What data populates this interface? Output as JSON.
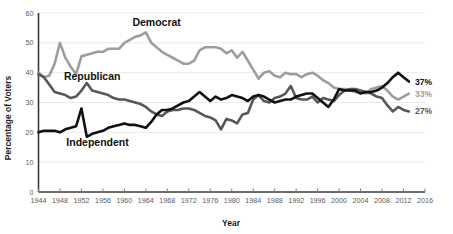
{
  "chart_data": {
    "type": "line",
    "title": "",
    "xlabel": "Year",
    "ylabel": "Percentage of Voters",
    "xlim": [
      1944,
      2016
    ],
    "ylim": [
      0,
      60
    ],
    "grid": true,
    "legend": "inline-labels",
    "xticks": [
      1944,
      1948,
      1952,
      1956,
      1960,
      1964,
      1968,
      1972,
      1976,
      1980,
      1984,
      1988,
      1992,
      1996,
      2000,
      2004,
      2008,
      2012,
      2016
    ],
    "yticks": [
      0,
      10,
      20,
      30,
      40,
      50,
      60
    ],
    "x": [
      1944,
      1945,
      1946,
      1947,
      1948,
      1949,
      1950,
      1951,
      1952,
      1953,
      1954,
      1955,
      1956,
      1957,
      1958,
      1959,
      1960,
      1961,
      1962,
      1963,
      1964,
      1965,
      1966,
      1967,
      1968,
      1969,
      1970,
      1971,
      1972,
      1973,
      1974,
      1975,
      1976,
      1977,
      1978,
      1979,
      1980,
      1981,
      1982,
      1983,
      1984,
      1985,
      1986,
      1987,
      1988,
      1989,
      1990,
      1991,
      1992,
      1993,
      1994,
      1995,
      1996,
      1997,
      1998,
      1999,
      2000,
      2001,
      2002,
      2003,
      2004,
      2005,
      2006,
      2007,
      2008,
      2009,
      2010,
      2011,
      2012,
      2013
    ],
    "series": [
      {
        "name": "Democrat",
        "color": "#9d9d9d",
        "end_label": "33%",
        "values": [
          40.0,
          38.5,
          39.0,
          43.0,
          50.0,
          45.0,
          42.0,
          39.5,
          45.5,
          46.0,
          46.5,
          47.0,
          47.0,
          48.0,
          48.0,
          48.0,
          50.0,
          51.0,
          52.0,
          52.5,
          53.5,
          50.0,
          48.5,
          47.0,
          46.0,
          45.0,
          44.0,
          43.0,
          43.0,
          44.0,
          47.5,
          48.5,
          48.5,
          48.5,
          48.0,
          46.5,
          47.5,
          45.0,
          47.0,
          44.0,
          41.0,
          38.0,
          40.0,
          40.5,
          39.0,
          38.5,
          40.0,
          39.5,
          39.5,
          38.5,
          39.5,
          40.0,
          39.0,
          37.5,
          36.5,
          35.0,
          34.5,
          34.5,
          34.0,
          33.5,
          33.5,
          33.0,
          34.5,
          35.0,
          35.5,
          34.0,
          32.0,
          31.0,
          32.0,
          33.0
        ]
      },
      {
        "name": "Republican",
        "color": "#575757",
        "end_label": "27%",
        "values": [
          39.5,
          38.5,
          36.0,
          33.5,
          33.0,
          32.5,
          31.5,
          32.0,
          34.0,
          36.5,
          34.0,
          33.5,
          33.0,
          32.5,
          31.5,
          31.0,
          31.0,
          30.5,
          30.0,
          29.5,
          28.5,
          27.0,
          26.0,
          25.5,
          27.0,
          27.5,
          27.5,
          28.0,
          28.0,
          27.5,
          26.5,
          25.5,
          25.0,
          24.0,
          21.0,
          24.5,
          24.0,
          23.0,
          26.0,
          26.5,
          31.0,
          32.5,
          30.5,
          30.0,
          31.5,
          32.0,
          33.0,
          35.5,
          31.5,
          31.0,
          31.0,
          32.0,
          30.0,
          31.5,
          31.0,
          30.5,
          32.5,
          34.0,
          34.5,
          34.5,
          34.0,
          33.5,
          33.0,
          32.0,
          31.5,
          29.0,
          27.0,
          28.5,
          27.5,
          27.0
        ]
      },
      {
        "name": "Independent",
        "color": "#111111",
        "end_label": "37%",
        "values": [
          20.0,
          20.5,
          20.5,
          20.5,
          20.0,
          21.0,
          21.5,
          22.0,
          28.0,
          18.5,
          19.5,
          20.0,
          20.5,
          21.5,
          22.0,
          22.5,
          23.0,
          22.5,
          22.5,
          22.0,
          21.5,
          23.5,
          26.0,
          27.5,
          27.5,
          28.0,
          29.0,
          30.0,
          30.5,
          32.0,
          33.5,
          32.0,
          30.5,
          32.0,
          31.0,
          31.5,
          32.5,
          32.0,
          31.5,
          30.5,
          32.0,
          32.5,
          32.0,
          31.0,
          30.0,
          30.5,
          31.0,
          31.0,
          32.0,
          32.5,
          33.0,
          33.0,
          31.5,
          30.0,
          28.5,
          31.0,
          34.5,
          34.0,
          34.0,
          34.0,
          33.0,
          33.5,
          33.5,
          34.0,
          35.0,
          36.5,
          38.5,
          40.0,
          38.5,
          37.0
        ]
      }
    ],
    "annotations": [
      {
        "name": "Democrat",
        "text": "Democrat",
        "x": 1966,
        "y": 55.5
      },
      {
        "name": "Republican",
        "text": "Republican",
        "x": 1954,
        "y": 37.5
      },
      {
        "name": "Independent",
        "text": "Independent",
        "x": 1955,
        "y": 15.5
      }
    ]
  }
}
